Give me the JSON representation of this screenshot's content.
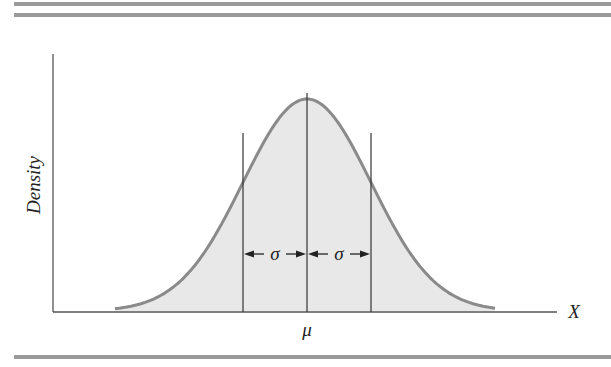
{
  "figure": {
    "y_axis_label": "Density",
    "x_axis_label": "X",
    "mean_label": "μ",
    "sigma_label_left": "σ",
    "sigma_label_right": "σ"
  },
  "colors": {
    "curve": "#8a8a8a",
    "fill": "#e6e6e6",
    "axis": "#444444",
    "rules": "#9a9a9a"
  },
  "chart_data": {
    "type": "area",
    "title": "",
    "xlabel": "X",
    "ylabel": "Density",
    "distribution": "normal",
    "annotations": [
      "μ at center",
      "σ from μ to μ-σ",
      "σ from μ to μ+σ"
    ],
    "x_range_sigma": [
      -2.9,
      2.9
    ],
    "grid": false,
    "legend": "none"
  }
}
